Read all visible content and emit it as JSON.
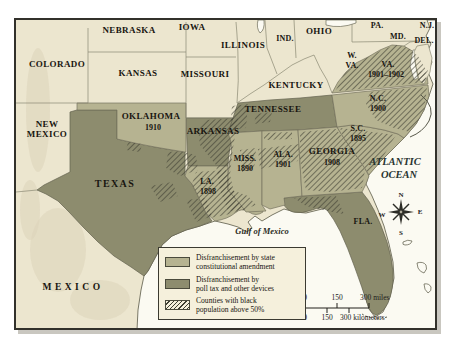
{
  "colors": {
    "cream_land": "#ece6cf",
    "terrain_shade": "#dcd4b9",
    "amendment": "#b6b391",
    "poll_tax": "#8d8c6e",
    "hatch_line": "#3e3e32",
    "water": "#fbfaf2",
    "legend_bg": "#f5f0dc",
    "text": "#181510"
  },
  "map": {
    "labels": [
      {
        "id": "colorado",
        "text": "COLORADO",
        "x": 57,
        "y": 67,
        "cls": "state"
      },
      {
        "id": "nebraska",
        "text": "NEBRASKA",
        "x": 129,
        "y": 33,
        "cls": "state"
      },
      {
        "id": "iowa",
        "text": "IOWA",
        "x": 192,
        "y": 30,
        "cls": "state"
      },
      {
        "id": "illinois",
        "text": "ILLINOIS",
        "x": 243,
        "y": 48,
        "cls": "state"
      },
      {
        "id": "indiana",
        "text": "IND.",
        "x": 285,
        "y": 41,
        "cls": "state-sm"
      },
      {
        "id": "ohio",
        "text": "OHIO",
        "x": 319,
        "y": 34,
        "cls": "state"
      },
      {
        "id": "pennsylvania",
        "text": "PA.",
        "x": 377,
        "y": 28,
        "cls": "state-sm"
      },
      {
        "id": "new-jersey",
        "text": "N.J.",
        "x": 427,
        "y": 28,
        "cls": "state-sm"
      },
      {
        "id": "maryland",
        "text": "MD.",
        "x": 398,
        "y": 39,
        "cls": "state-sm"
      },
      {
        "id": "delaware",
        "text": "DEL.",
        "x": 424,
        "y": 43,
        "cls": "state-sm"
      },
      {
        "id": "kansas",
        "text": "KANSAS",
        "x": 138,
        "y": 76,
        "cls": "state"
      },
      {
        "id": "missouri",
        "text": "MISSOURI",
        "x": 205,
        "y": 77,
        "cls": "state"
      },
      {
        "id": "kentucky",
        "text": "KENTUCKY",
        "x": 296,
        "y": 88,
        "cls": "state"
      },
      {
        "id": "west-virginia-line1",
        "text": "W.",
        "x": 352,
        "y": 58,
        "cls": "state-sm"
      },
      {
        "id": "west-virginia-line2",
        "text": "VA.",
        "x": 352,
        "y": 68,
        "cls": "state-sm"
      },
      {
        "id": "virginia",
        "text": "VA.",
        "x": 388,
        "y": 67,
        "cls": "state-sm"
      },
      {
        "id": "virginia-date",
        "text": "1901–1902",
        "x": 386,
        "y": 77,
        "cls": "date"
      },
      {
        "id": "new-mexico-line1",
        "text": "NEW",
        "x": 47,
        "y": 127,
        "cls": "state"
      },
      {
        "id": "new-mexico-line2",
        "text": "MEXICO",
        "x": 47,
        "y": 137,
        "cls": "state"
      },
      {
        "id": "oklahoma",
        "text": "OKLAHOMA",
        "x": 151,
        "y": 119,
        "cls": "state"
      },
      {
        "id": "oklahoma-date",
        "text": "1910",
        "x": 153,
        "y": 130,
        "cls": "date"
      },
      {
        "id": "arkansas",
        "text": "ARKANSAS",
        "x": 213,
        "y": 134,
        "cls": "state"
      },
      {
        "id": "tennessee",
        "text": "TENNESSEE",
        "x": 273,
        "y": 112,
        "cls": "state"
      },
      {
        "id": "north-carolina",
        "text": "N.C.",
        "x": 378,
        "y": 101,
        "cls": "state-sm"
      },
      {
        "id": "north-carolina-date",
        "text": "1900",
        "x": 378,
        "y": 111,
        "cls": "date"
      },
      {
        "id": "south-carolina",
        "text": "S.C.",
        "x": 358,
        "y": 131,
        "cls": "state-sm"
      },
      {
        "id": "south-carolina-date",
        "text": "1895",
        "x": 358,
        "y": 141,
        "cls": "date"
      },
      {
        "id": "mississippi",
        "text": "MISS.",
        "x": 245,
        "y": 161,
        "cls": "state-sm"
      },
      {
        "id": "mississippi-date",
        "text": "1890",
        "x": 245,
        "y": 171,
        "cls": "date"
      },
      {
        "id": "alabama",
        "text": "ALA.",
        "x": 283,
        "y": 157,
        "cls": "state-sm"
      },
      {
        "id": "alabama-date",
        "text": "1901",
        "x": 283,
        "y": 167,
        "cls": "date"
      },
      {
        "id": "georgia",
        "text": "GEORGIA",
        "x": 332,
        "y": 154,
        "cls": "state"
      },
      {
        "id": "georgia-date",
        "text": "1908",
        "x": 332,
        "y": 165,
        "cls": "date"
      },
      {
        "id": "atlantic-line1",
        "text": "ATLANTIC",
        "x": 395,
        "y": 165,
        "cls": "ocean"
      },
      {
        "id": "atlantic-line2",
        "text": "OCEAN",
        "x": 399,
        "y": 178,
        "cls": "ocean"
      },
      {
        "id": "texas",
        "text": "TEXAS",
        "x": 115,
        "y": 187,
        "cls": "state-lg"
      },
      {
        "id": "louisiana",
        "text": "LA.",
        "x": 207,
        "y": 184,
        "cls": "state-sm"
      },
      {
        "id": "louisiana-date",
        "text": "1898",
        "x": 208,
        "y": 194,
        "cls": "date"
      },
      {
        "id": "florida",
        "text": "FLA.",
        "x": 363,
        "y": 224,
        "cls": "state-sm"
      },
      {
        "id": "gulf-of-mexico",
        "text": "Gulf of Mexico",
        "x": 262,
        "y": 234,
        "cls": "gulf"
      },
      {
        "id": "mexico",
        "text": "MEXICO",
        "x": 73,
        "y": 290,
        "cls": "mexico"
      }
    ]
  },
  "legend": {
    "items": [
      {
        "line1": "Disfranchisement by state",
        "line2": "constitutional amendment"
      },
      {
        "line1": "Disfranchisement by",
        "line2": "poll tax and other devices"
      },
      {
        "line1": "Counties with black",
        "line2": "population above 50%"
      }
    ]
  },
  "scale_bar": {
    "miles": [
      "0",
      "150",
      "300 miles"
    ],
    "kilometers": [
      "0",
      "150",
      "300 kilometers"
    ]
  },
  "compass": {
    "n": "N",
    "e": "E",
    "s": "S",
    "w": "W"
  }
}
